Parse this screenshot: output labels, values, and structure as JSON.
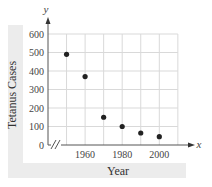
{
  "chart_data": {
    "type": "scatter",
    "title": "",
    "xlabel": "Year",
    "ylabel": "Tetanus Cases",
    "x_axis_letter": "x",
    "y_axis_letter": "y",
    "x": [
      1950,
      1960,
      1970,
      1980,
      1990,
      2000
    ],
    "values": [
      490,
      370,
      150,
      100,
      65,
      45
    ],
    "x_tick_labels": [
      "1960",
      "1980",
      "2000"
    ],
    "x_ticks": [
      1960,
      1980,
      2000
    ],
    "y_tick_labels": [
      "0",
      "100",
      "200",
      "300",
      "400",
      "500",
      "600"
    ],
    "y_ticks": [
      0,
      100,
      200,
      300,
      400,
      500,
      600
    ],
    "xlim": [
      1940,
      2010
    ],
    "ylim": [
      0,
      600
    ],
    "grid": true,
    "axis_break": "x-axis break symbol (//) near origin",
    "legend": null
  },
  "colors": {
    "grid": "#d9d9d9",
    "axis": "#555555",
    "point": "#222222",
    "label_band": "#ececec"
  }
}
